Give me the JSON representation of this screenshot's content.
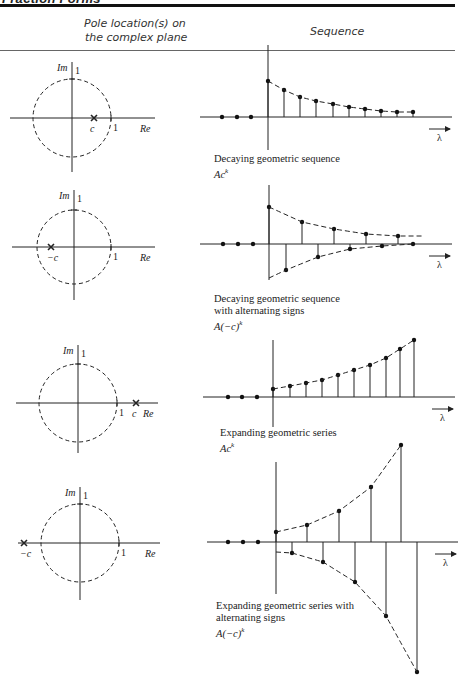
{
  "header": {
    "title_partial": "Fraction Forms",
    "col_pole": [
      "Pole location(s) on",
      "the complex plane"
    ],
    "col_sequence": "Sequence"
  },
  "axis_labels": {
    "im": "Im",
    "re": "Re",
    "one": "1",
    "lambda": "λ"
  },
  "rows": [
    {
      "pole_label": "c",
      "caption": [
        "Decaying geometric sequence"
      ],
      "formula": "Ac^k",
      "formula_main": "Ac",
      "formula_exp": "k"
    },
    {
      "pole_label": "−c",
      "caption": [
        "Decaying geometric sequence",
        "with alternating signs"
      ],
      "formula": "A(−c)^k",
      "formula_main": "A(−c)",
      "formula_exp": "k"
    },
    {
      "pole_label": "c",
      "caption": [
        "Expanding geometric series"
      ],
      "formula": "Ac^k",
      "formula_main": "Ac",
      "formula_exp": "k"
    },
    {
      "pole_label": "−c",
      "caption": [
        "Expanding geometric series with",
        "alternating signs"
      ],
      "formula": "A(−c)^k",
      "formula_main": "A(−c)",
      "formula_exp": "k"
    }
  ],
  "chart_data": [
    {
      "type": "scatter",
      "title": "Decaying geometric sequence Ac^k",
      "pole": "inside unit circle, positive real (c)",
      "x": [
        -3,
        -2,
        -1,
        0,
        1,
        2,
        3,
        4,
        5,
        6,
        7,
        8,
        9
      ],
      "values": [
        0,
        0,
        0,
        1.0,
        0.75,
        0.56,
        0.45,
        0.36,
        0.28,
        0.22,
        0.17,
        0.14,
        0.14
      ],
      "xlabel": "λ"
    },
    {
      "type": "scatter",
      "title": "Decaying geometric sequence with alternating signs A(−c)^k",
      "pole": "inside unit circle, negative real (−c)",
      "x": [
        -3,
        -2,
        -1,
        0,
        1,
        2,
        3,
        4,
        5,
        6,
        7,
        8,
        9
      ],
      "values": [
        0,
        0,
        0,
        1.0,
        -0.7,
        0.6,
        -0.35,
        0.41,
        -0.14,
        0.27,
        -0.06,
        0.22,
        0.0
      ],
      "xlabel": "λ"
    },
    {
      "type": "scatter",
      "title": "Expanding geometric series Ac^k",
      "pole": "outside unit circle, positive real (c)",
      "x": [
        -3,
        -2,
        -1,
        0,
        1,
        2,
        3,
        4,
        5,
        6,
        7,
        8,
        9
      ],
      "values": [
        0,
        0,
        0,
        0.14,
        0.19,
        0.24,
        0.29,
        0.36,
        0.45,
        0.54,
        0.68,
        0.84,
        1.0
      ],
      "xlabel": "λ"
    },
    {
      "type": "scatter",
      "title": "Expanding geometric series with alternating signs A(−c)^k",
      "pole": "outside unit circle, negative real (−c)",
      "x": [
        -3,
        -2,
        -1,
        0,
        1,
        2,
        3,
        4,
        5,
        6,
        7,
        8,
        9
      ],
      "values": [
        0,
        0,
        0,
        0.08,
        -0.08,
        0.14,
        -0.15,
        0.24,
        -0.31,
        0.42,
        -0.57,
        0.75,
        -1.0
      ],
      "xlabel": "λ"
    }
  ]
}
